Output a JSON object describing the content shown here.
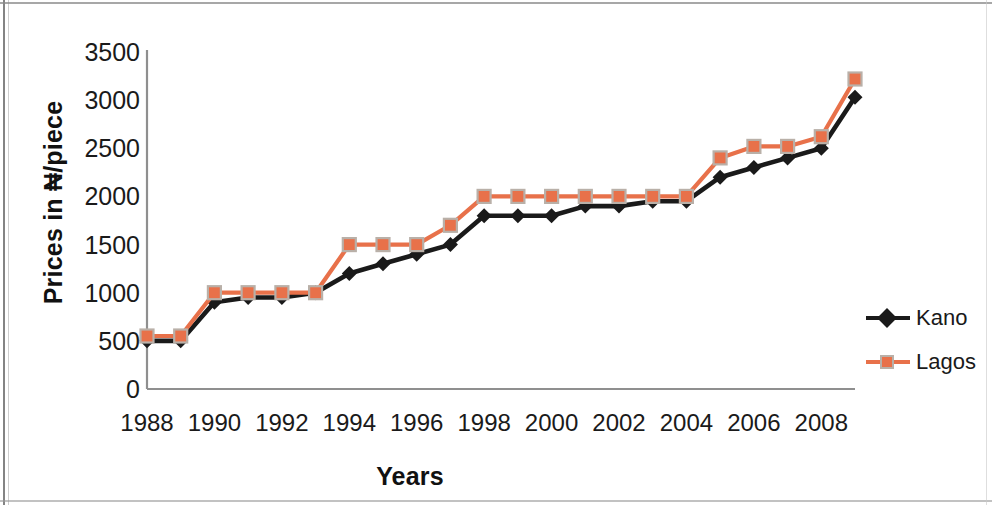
{
  "chart_data": {
    "type": "line",
    "title": "",
    "xlabel": "Years",
    "ylabel": "Prices in ₦/piece",
    "x": [
      1988,
      1989,
      1990,
      1991,
      1992,
      1993,
      1994,
      1995,
      1996,
      1997,
      1998,
      1999,
      2000,
      2001,
      2002,
      2003,
      2004,
      2005,
      2006,
      2007,
      2008,
      2009
    ],
    "xtick_labels": [
      "1988",
      "1990",
      "1992",
      "1994",
      "1996",
      "1998",
      "2000",
      "2002",
      "2004",
      "2006",
      "2008"
    ],
    "xticks": [
      1988,
      1990,
      1992,
      1994,
      1996,
      1998,
      2000,
      2002,
      2004,
      2006,
      2008
    ],
    "ytick_labels": [
      "0",
      "500",
      "1000",
      "1500",
      "2000",
      "2500",
      "3000",
      "3500"
    ],
    "yticks": [
      0,
      500,
      1000,
      1500,
      2000,
      2500,
      3000,
      3500
    ],
    "ylim": [
      0,
      3500
    ],
    "xlim": [
      1988,
      2009
    ],
    "grid": false,
    "legend_position": "right",
    "series": [
      {
        "name": "Kano",
        "color": "#1a1a1a",
        "marker": "diamond",
        "values": [
          500,
          500,
          900,
          950,
          950,
          1000,
          1200,
          1300,
          1400,
          1500,
          1800,
          1800,
          1800,
          1900,
          1900,
          1950,
          1950,
          2200,
          2300,
          2400,
          2500,
          3030
        ]
      },
      {
        "name": "Lagos",
        "color": "#E8714A",
        "marker": "square",
        "values": [
          550,
          550,
          1000,
          1000,
          1000,
          1000,
          1500,
          1500,
          1500,
          1700,
          2000,
          2000,
          2000,
          2000,
          2000,
          2000,
          2000,
          2400,
          2520,
          2520,
          2620,
          3220
        ]
      }
    ]
  },
  "legend": {
    "items": [
      {
        "label": "Kano"
      },
      {
        "label": "Lagos"
      }
    ]
  },
  "axes": {
    "x_title": "Years",
    "y_title": "Prices in ₦/piece"
  },
  "colors": {
    "kano": "#1a1a1a",
    "lagos": "#E8714A",
    "lagos_marker_edge": "#b9b0a8",
    "axis": "#8f8f8f",
    "text": "#1a1a1a"
  }
}
